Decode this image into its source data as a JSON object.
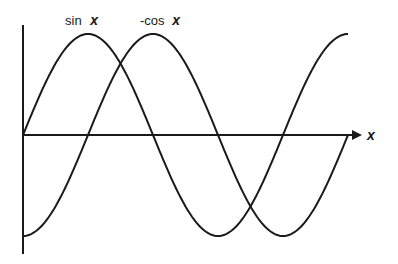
{
  "chart_data": {
    "type": "line",
    "title": "",
    "xlabel": "x",
    "ylabel": "",
    "grid": false,
    "legend_position": "inline labels above peaks",
    "x": [
      0,
      0.7854,
      1.5708,
      2.3562,
      3.1416,
      3.927,
      4.7124,
      5.4978,
      6.2832,
      7.0686,
      7.854
    ],
    "x_range": [
      0,
      7.854
    ],
    "ylim": [
      -1,
      1
    ],
    "series": [
      {
        "name": "sin x",
        "label_prefix": "sin",
        "label_var": "x",
        "values": [
          0,
          0.7071,
          1,
          0.7071,
          0,
          -0.7071,
          -1,
          -0.7071,
          0,
          0.7071,
          1
        ]
      },
      {
        "name": "-cos x",
        "label_prefix": "-cos",
        "label_var": "x",
        "values": [
          -1,
          -0.7071,
          0,
          0.7071,
          1,
          0.7071,
          0,
          -0.7071,
          -1,
          -0.7071,
          0
        ]
      }
    ],
    "colors": {
      "curve": "#1a1a1a",
      "axis": "#1a1a1a",
      "background": "#ffffff"
    }
  }
}
